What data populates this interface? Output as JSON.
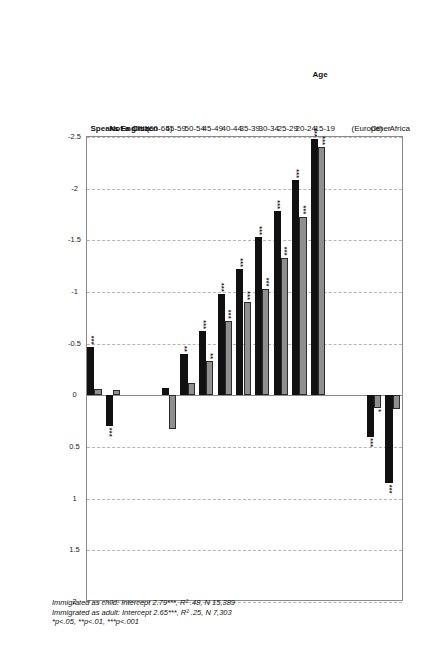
{
  "chart_data": {
    "type": "bar",
    "orientation": "horizontal",
    "title": "",
    "xlabel": "",
    "ylabel": "",
    "xlim": [
      -2.5,
      2
    ],
    "xticks": [
      "-2.5",
      "-2",
      "-1.5",
      "-1",
      "-0.5",
      "0",
      "0.5",
      "1",
      "1.5",
      "2"
    ],
    "xtick_values": [
      -2.5,
      -2,
      -1.5,
      -1,
      -0.5,
      0,
      0.5,
      1,
      1.5,
      2
    ],
    "grid": "vertical-dashed",
    "legend": [
      {
        "name": "Immigrated as child",
        "color": "#8f8f8f"
      },
      {
        "name": "Immigrated as adult",
        "color": "#111111"
      }
    ],
    "groups": [
      {
        "heading": "",
        "categories": [
          {
            "label": "Africa",
            "bold": false,
            "child": 0.13,
            "adult": 0.85,
            "child_sig": "",
            "adult_sig": "***"
          },
          {
            "label": "Other",
            "bold": false,
            "child": 0.12,
            "adult": 0.4,
            "child_sig": "*",
            "adult_sig": "***"
          },
          {
            "label": "(Europe)",
            "bold": false,
            "child": null,
            "adult": null,
            "child_sig": "",
            "adult_sig": ""
          }
        ]
      },
      {
        "heading": "Age",
        "categories": [
          {
            "label": "15-19",
            "bold": false,
            "child": -2.4,
            "adult": -2.48,
            "child_sig": "***",
            "adult_sig": "***"
          },
          {
            "label": "20-24",
            "bold": false,
            "child": -1.73,
            "adult": -2.08,
            "child_sig": "***",
            "adult_sig": "***"
          },
          {
            "label": "25-29",
            "bold": false,
            "child": -1.33,
            "adult": -1.78,
            "child_sig": "***",
            "adult_sig": "***"
          },
          {
            "label": "30-34",
            "bold": false,
            "child": -1.03,
            "adult": -1.53,
            "child_sig": "***",
            "adult_sig": "***"
          },
          {
            "label": "35-39",
            "bold": false,
            "child": -0.9,
            "adult": -1.22,
            "child_sig": "***",
            "adult_sig": "***"
          },
          {
            "label": "40-44",
            "bold": false,
            "child": -0.72,
            "adult": -0.98,
            "child_sig": "***",
            "adult_sig": "***"
          },
          {
            "label": "45-49",
            "bold": false,
            "child": -0.33,
            "adult": -0.62,
            "child_sig": "**",
            "adult_sig": "***"
          },
          {
            "label": "50-54",
            "bold": false,
            "child": -0.12,
            "adult": -0.4,
            "child_sig": "",
            "adult_sig": "**"
          },
          {
            "label": "55-59",
            "bold": false,
            "child": 0.33,
            "adult": -0.07,
            "child_sig": "",
            "adult_sig": ""
          },
          {
            "label": "(60-64)",
            "bold": false,
            "child": null,
            "adult": null,
            "child_sig": "",
            "adult_sig": ""
          }
        ]
      },
      {
        "heading": "",
        "categories": [
          {
            "label": "Not a Citizen",
            "bold": true,
            "child": -0.05,
            "adult": 0.3,
            "child_sig": "",
            "adult_sig": "***"
          },
          {
            "label": "Speaks English",
            "bold": true,
            "child": -0.06,
            "adult": -0.47,
            "child_sig": "",
            "adult_sig": "***"
          }
        ]
      }
    ]
  },
  "footnote": {
    "line1_label": "Immigrated as child:",
    "line1_rest": " Intercept 2.79***, R² .48, N 15,389",
    "line2_label": "Immigrated as adult:",
    "line2_rest": " Intercept 2.65***, R² .25, N 7,303",
    "line3": "*p<.05, **p<.01, ***p<.001"
  }
}
